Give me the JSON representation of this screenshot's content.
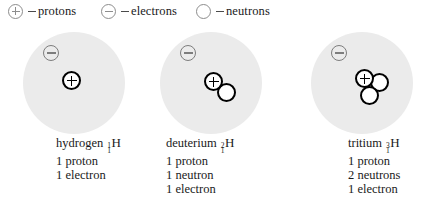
{
  "legend": {
    "items": [
      {
        "symbol": "plus-circle",
        "equals": "=",
        "label": "protons"
      },
      {
        "symbol": "minus-circle",
        "equals": "=",
        "label": "electrons"
      },
      {
        "symbol": "empty-circle",
        "equals": "=",
        "label": "neutrons"
      }
    ]
  },
  "isotopes": [
    {
      "name": "hydrogen",
      "mass_number": "1",
      "atomic_number": "1",
      "element_symbol": "H",
      "protons": 1,
      "neutrons": 0,
      "electrons": 1,
      "details": [
        "1 proton",
        "1 electron"
      ]
    },
    {
      "name": "deuterium",
      "mass_number": "2",
      "atomic_number": "1",
      "element_symbol": "H",
      "protons": 1,
      "neutrons": 1,
      "electrons": 1,
      "details": [
        "1 proton",
        "1 neutron",
        "1 electron"
      ]
    },
    {
      "name": "tritium",
      "mass_number": "3",
      "atomic_number": "1",
      "element_symbol": "H",
      "protons": 1,
      "neutrons": 2,
      "electrons": 1,
      "details": [
        "1 proton",
        "2 neutrons",
        "1 electron"
      ]
    }
  ],
  "colors": {
    "electron_cloud": "#ebebeb",
    "nucleus_stroke": "#000000",
    "legend_stroke": "#8d8d8d",
    "electron_stroke": "#7d7d7d",
    "text": "#1a1a1a",
    "background": "#ffffff"
  }
}
